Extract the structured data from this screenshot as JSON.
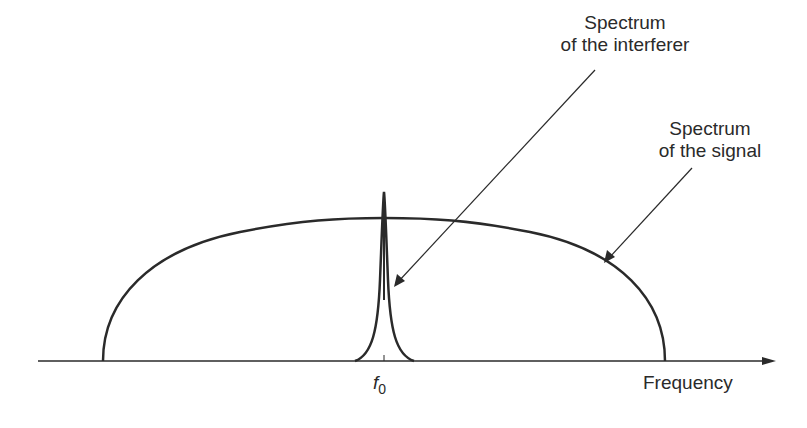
{
  "diagram": {
    "labels": {
      "interferer_line1": "Spectrum",
      "interferer_line2": "of the interferer",
      "signal_line1": "Spectrum",
      "signal_line2": "of the signal",
      "x_axis": "Frequency",
      "center_frequency": "f",
      "center_frequency_sub": "0"
    },
    "colors": {
      "ink": "#2a2a2a",
      "background": "#ffffff"
    }
  }
}
